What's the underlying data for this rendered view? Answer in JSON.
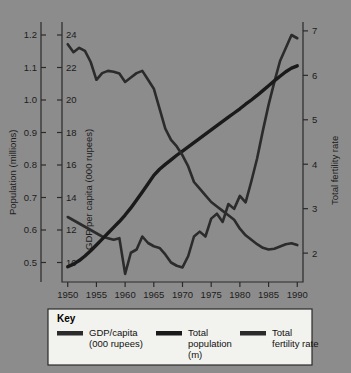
{
  "figure": {
    "background_color": "#8c8c8c",
    "line_color": "#2b2b2b",
    "population_line_color": "#1a1a1a"
  },
  "chart_data": {
    "type": "line",
    "title": "",
    "xlabel": "",
    "x": [
      1950,
      1951,
      1952,
      1953,
      1954,
      1955,
      1956,
      1957,
      1958,
      1959,
      1960,
      1961,
      1962,
      1963,
      1964,
      1965,
      1966,
      1967,
      1968,
      1969,
      1970,
      1971,
      1972,
      1973,
      1974,
      1975,
      1976,
      1977,
      1978,
      1979,
      1980,
      1981,
      1982,
      1983,
      1984,
      1985,
      1986,
      1987,
      1988,
      1989,
      1990
    ],
    "xticks": [
      1950,
      1955,
      1960,
      1965,
      1970,
      1975,
      1980,
      1985,
      1990
    ],
    "xlim": [
      1949,
      1991
    ],
    "axes": [
      {
        "id": "left-population",
        "label": "Population (millions)",
        "ticks": [
          0.5,
          0.6,
          0.7,
          0.8,
          0.9,
          1.0,
          1.1,
          1.2
        ],
        "tick_labels": [
          "0.5",
          "0.6",
          "0.7",
          "0.8",
          "0.9",
          "1.0",
          "1.1",
          "1.2"
        ],
        "lim": [
          0.44,
          1.24
        ],
        "position": "left-outer"
      },
      {
        "id": "left-gdp",
        "label": "GDP per capita (000 rupees)",
        "ticks": [
          10,
          12,
          14,
          16,
          18,
          20,
          22,
          24
        ],
        "tick_labels": [
          "10",
          "12",
          "14",
          "16",
          "18",
          "20",
          "22",
          "24"
        ],
        "lim": [
          8.8,
          24.8
        ],
        "position": "left-inner"
      },
      {
        "id": "right-fertility",
        "label": "Total fertility rate",
        "ticks": [
          2,
          3,
          4,
          5,
          6,
          7
        ],
        "tick_labels": [
          "2",
          "3",
          "4",
          "5",
          "6",
          "7"
        ],
        "lim": [
          1.35,
          7.2
        ],
        "position": "right"
      }
    ],
    "grid": false,
    "legend_position": "below-plot",
    "series": [
      {
        "name": "GDP/capita (000 rupees)",
        "axis": "left-gdp",
        "units": "000 rupees",
        "values": [
          12.8,
          12.6,
          12.4,
          12.2,
          12.0,
          11.8,
          11.6,
          11.5,
          11.4,
          11.5,
          9.3,
          10.6,
          10.8,
          11.6,
          11.2,
          11.0,
          10.9,
          10.5,
          10.0,
          9.8,
          9.7,
          10.4,
          11.6,
          11.9,
          11.6,
          12.7,
          13.0,
          12.5,
          13.6,
          13.3,
          14.1,
          13.7,
          15.0,
          16.4,
          18.1,
          19.7,
          21.1,
          22.4,
          23.2,
          24.0,
          23.8
        ]
      },
      {
        "name": "Total population (m)",
        "axis": "left-population",
        "units": "millions",
        "values": [
          0.487,
          0.495,
          0.506,
          0.52,
          0.536,
          0.554,
          0.572,
          0.59,
          0.608,
          0.626,
          0.646,
          0.668,
          0.692,
          0.717,
          0.742,
          0.768,
          0.787,
          0.802,
          0.816,
          0.83,
          0.843,
          0.856,
          0.869,
          0.882,
          0.895,
          0.908,
          0.921,
          0.934,
          0.947,
          0.96,
          0.973,
          0.987,
          1.0,
          1.014,
          1.029,
          1.044,
          1.059,
          1.073,
          1.087,
          1.098,
          1.105
        ]
      },
      {
        "name": "Total fertility rate",
        "axis": "right-fertility",
        "units": "births per woman",
        "values": [
          6.7,
          6.52,
          6.62,
          6.55,
          6.3,
          5.9,
          6.05,
          6.1,
          6.08,
          6.04,
          5.85,
          5.95,
          6.05,
          6.1,
          5.9,
          5.7,
          5.25,
          4.8,
          4.55,
          4.4,
          4.2,
          3.95,
          3.6,
          3.45,
          3.3,
          3.15,
          3.05,
          2.95,
          2.85,
          2.75,
          2.55,
          2.4,
          2.3,
          2.2,
          2.12,
          2.08,
          2.1,
          2.15,
          2.2,
          2.22,
          2.18
        ]
      }
    ]
  },
  "legend": {
    "title": "Key",
    "entries": [
      {
        "label_line1": "GDP/capita",
        "label_line2": "(000 rupees)",
        "label_line3": "",
        "color": "#2b2b2b"
      },
      {
        "label_line1": "Total",
        "label_line2": "population",
        "label_line3": "(m)",
        "color": "#1a1a1a"
      },
      {
        "label_line1": "Total",
        "label_line2": "fertility rate",
        "label_line3": "",
        "color": "#2b2b2b"
      }
    ]
  }
}
